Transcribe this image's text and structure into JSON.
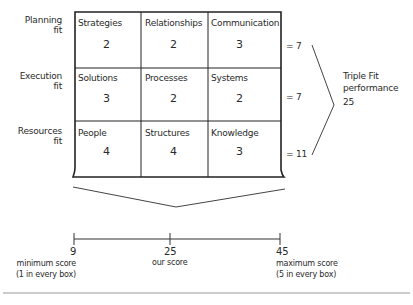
{
  "row_labels": [
    {
      "line1": "Planning",
      "line2": "fit"
    },
    {
      "line1": "Execution",
      "line2": "fit"
    },
    {
      "line1": "Resources",
      "line2": "fit"
    }
  ],
  "grid": [
    [
      {
        "title": "Strategies",
        "value": "2"
      },
      {
        "title": "Relationships",
        "value": "2"
      },
      {
        "title": "Communication",
        "value": "3"
      }
    ],
    [
      {
        "title": "Solutions",
        "value": "3"
      },
      {
        "title": "Processes",
        "value": "2"
      },
      {
        "title": "Systems",
        "value": "2"
      }
    ],
    [
      {
        "title": "People",
        "value": "4"
      },
      {
        "title": "Structures",
        "value": "4"
      },
      {
        "title": "Knowledge",
        "value": "3"
      }
    ]
  ],
  "row_totals": [
    "= 7",
    "= 7",
    "= 11"
  ],
  "summary": {
    "line1": "Triple Fit",
    "line2": "performance",
    "value": "25"
  },
  "scale": {
    "ticks": [
      {
        "value": "9",
        "label1": "minimum score",
        "label2": "(1 in every box)"
      },
      {
        "value": "25",
        "label1": "our score",
        "label2": ""
      },
      {
        "value": "45",
        "label1": "maximum score",
        "label2": "(5 in every box)"
      }
    ]
  },
  "colors": {
    "ink": "#222222",
    "rule": "#9a9a9a"
  }
}
